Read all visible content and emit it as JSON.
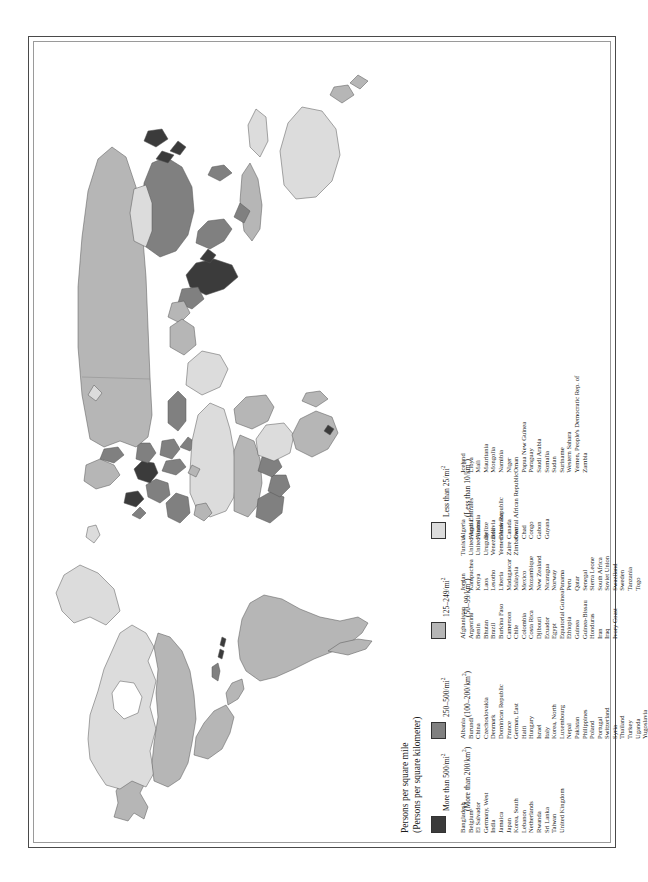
{
  "legend": {
    "title_line1": "Persons per square mile",
    "title_line2": "(Persons per square kilometer)",
    "categories": [
      {
        "swatch_color": "#3b3b3b",
        "label_line1": "More than 500/mi",
        "label_sup1": "2",
        "label_line2": "(More than 200/km",
        "label_sup2": "2",
        "label_tail2": ")",
        "countries": [
          "Bangladesh",
          "Belgium",
          "El Salvador",
          "Germany, West",
          "India",
          "Jamaica",
          "Japan",
          "Korea, South",
          "Lebanon",
          "Netherlands",
          "Rwanda",
          "Sri Lanka",
          "Taiwan",
          "United Kingdom"
        ]
      },
      {
        "swatch_color": "#808080",
        "label_line1": "250–500/mi",
        "label_sup1": "2",
        "label_line2": "(100–200/km",
        "label_sup2": "2",
        "label_tail2": ")",
        "countries": [
          "Albania",
          "Burundi",
          "China",
          "Czechoslovakia",
          "Denmark",
          "Dominican Republic",
          "France",
          "German, East",
          "Haiti",
          "Hungary",
          "Israel",
          "Italy",
          "Korea, North",
          "Luxembourg",
          "Nepal",
          "Pakistan",
          "Philippines",
          "Poland",
          "Portugal",
          "Switzerland",
          "Syria",
          "Thailand",
          "Turkey",
          "Uganda",
          "Yugoslavia"
        ]
      },
      {
        "swatch_color": "#b6b6b6",
        "label_line1": "125–249/mi",
        "label_sup1": "2",
        "label_line2": "(50–99/km",
        "label_sup2": "2",
        "label_tail2": ")",
        "countries": [
          "Afghanistan",
          "Argentina",
          "Benin",
          "Bhutan",
          "Brazil",
          "Burkina Faso",
          "Cameroon",
          "Chile",
          "Colombia",
          "Costa Rica",
          "Djibouti",
          "Ecuador",
          "Egypt",
          "Equatorial Guinea",
          "Ethiopia",
          "Guinea",
          "Guinea-Bissau",
          "Honduras",
          "Iran",
          "Iraq",
          "Ivory Coast",
          "Jordan",
          "Kampuchea",
          "Kenya",
          "Laos",
          "Lesotho",
          "Liberia",
          "Madagascar",
          "Malaysia",
          "Mexico",
          "Mozambique",
          "New Zealand",
          "Nicaragua",
          "Norway",
          "Panama",
          "Peru",
          "Qatar",
          "Senegal",
          "Sierra Leone",
          "South Africa",
          "Soviet Union",
          "Swaziland",
          "Sweden",
          "Tanzania",
          "Togo",
          "Tunisia",
          "United Arab Emirates",
          "United States",
          "Uruguay",
          "Venezuela",
          "Yemen Arab Republic",
          "Zaire",
          "Zimbabwe"
        ]
      },
      {
        "swatch_color": "#dcdcdc",
        "label_line1": "Less than 25/mi",
        "label_sup1": "2",
        "label_line2": "(Less than 10/km",
        "label_sup2": "2",
        "label_tail2": ")",
        "countries": [
          "Algeria",
          "Angola",
          "Australia",
          "Belize",
          "Bolivia",
          "Botswana",
          "Canada",
          "Central African Republic",
          "Chad",
          "Congo",
          "Gabon",
          "Guyana",
          "Iceland",
          "Libya",
          "Mali",
          "Mauritania",
          "Mongolia",
          "Namibia",
          "Niger",
          "Oman",
          "Papua New Guinea",
          "Paraguay",
          "Saudi Arabia",
          "Somalia",
          "Sudan",
          "Suriname",
          "Western Sahara",
          "Yemen, People's Democratic Rep. of",
          "Zambia"
        ]
      }
    ]
  },
  "colors": {
    "very_high": "#3b3b3b",
    "high": "#808080",
    "medium": "#b6b6b6",
    "low": "#dcdcdc",
    "ocean": "#ffffff",
    "border": "#555555",
    "frame": "#4a4a4a"
  },
  "map": {
    "projection_note": "world outline, shaded choropleth",
    "title": ""
  }
}
